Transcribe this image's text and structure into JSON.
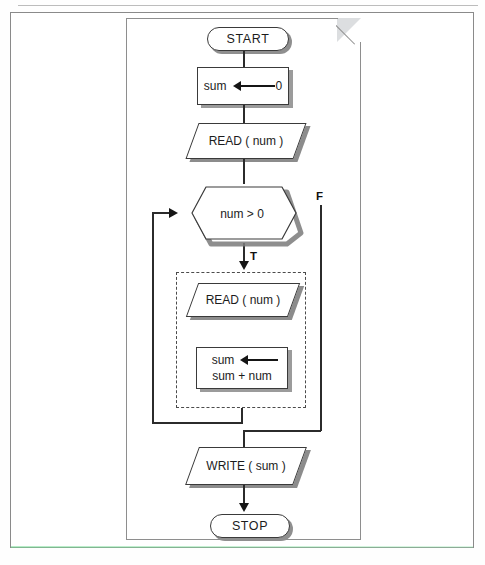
{
  "diagram": {
    "nodes": {
      "start": {
        "label": "START",
        "shape": "terminal"
      },
      "init": {
        "var": "sum",
        "value": "0",
        "shape": "process"
      },
      "read_first": {
        "label": "READ ( num )",
        "shape": "input-output"
      },
      "decision": {
        "label": "num > 0",
        "shape": "hexagon"
      },
      "read_loop": {
        "label": "READ ( num )",
        "shape": "input-output"
      },
      "accumulate": {
        "var": "sum",
        "expr": "sum + num",
        "shape": "process"
      },
      "write": {
        "label": "WRITE ( sum )",
        "shape": "input-output"
      },
      "stop": {
        "label": "STOP",
        "shape": "terminal"
      }
    },
    "branch_labels": {
      "true": "T",
      "false": "F"
    },
    "loop_body": {
      "style": "dashed",
      "contains": [
        "read_loop",
        "accumulate"
      ]
    },
    "colors": {
      "line": "#2b2b2b",
      "shape_border": "#3a3a3a",
      "shape_fill": "#ffffff",
      "shadow": "#9a9a9a",
      "page_border": "#8e8e8e",
      "frame_border": "#8a8a8a"
    }
  }
}
